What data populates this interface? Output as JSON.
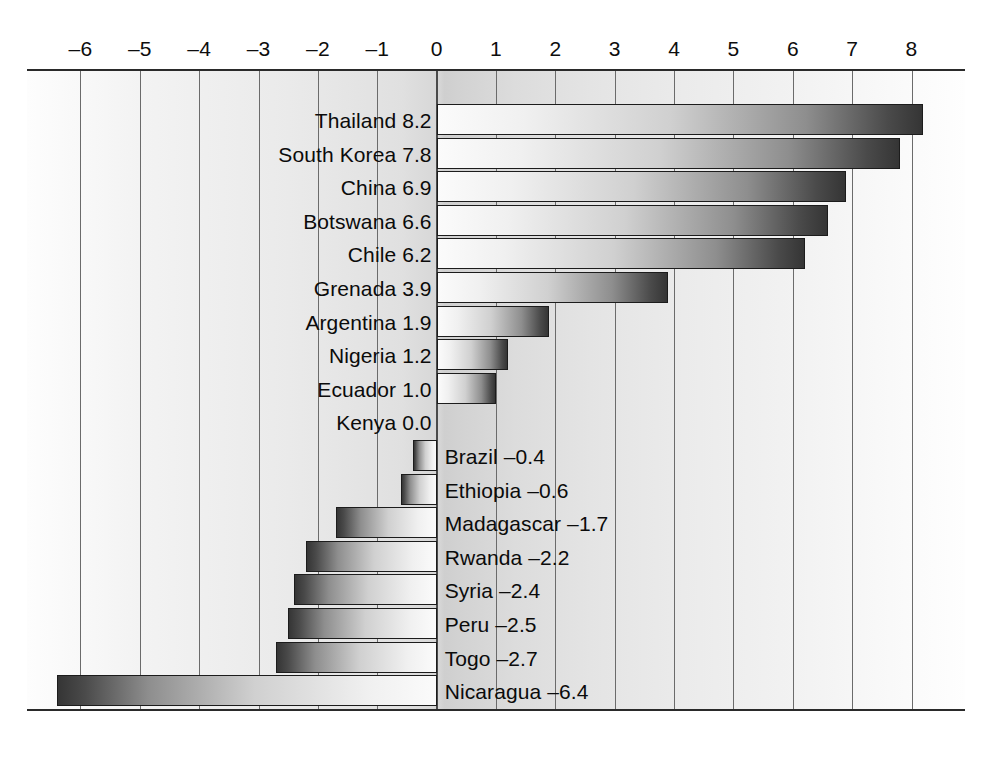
{
  "chart_data": {
    "type": "bar",
    "orientation": "horizontal",
    "title": "",
    "subtitle": "",
    "xlabel": "",
    "ylabel": "",
    "xlim": [
      -6.6,
      8.4
    ],
    "axis_min": -6.6,
    "axis_max": 8.4,
    "grid": true,
    "legend": "none",
    "tick_labels": [
      "–6",
      "–5",
      "–4",
      "–3",
      "–2",
      "–1",
      "0",
      "1",
      "2",
      "3",
      "4",
      "5",
      "6",
      "7",
      "8"
    ],
    "tick_values": [
      -6,
      -5,
      -4,
      -3,
      -2,
      -1,
      0,
      1,
      2,
      3,
      4,
      5,
      6,
      7,
      8
    ],
    "categories": [
      "Thailand",
      "South Korea",
      "China",
      "Botswana",
      "Chile",
      "Grenada",
      "Argentina",
      "Nigeria",
      "Ecuador",
      "Kenya",
      "Brazil",
      "Ethiopia",
      "Madagascar",
      "Rwanda",
      "Syria",
      "Peru",
      "Togo",
      "Nicaragua",
      "Cameroon"
    ],
    "values": [
      8.2,
      7.8,
      6.9,
      6.6,
      6.2,
      3.9,
      1.9,
      1.2,
      1.0,
      0.0,
      -0.4,
      -0.6,
      -1.7,
      -2.2,
      -2.4,
      -2.5,
      -2.7,
      -6.4,
      -6.6
    ],
    "bars": [
      {
        "label": "Thailand 8.2",
        "category": "Thailand",
        "value": 8.2,
        "display_value": "8.2",
        "sign": "positive"
      },
      {
        "label": "South Korea 7.8",
        "category": "South Korea",
        "value": 7.8,
        "display_value": "7.8",
        "sign": "positive"
      },
      {
        "label": "China 6.9",
        "category": "China",
        "value": 6.9,
        "display_value": "6.9",
        "sign": "positive"
      },
      {
        "label": "Botswana 6.6",
        "category": "Botswana",
        "value": 6.6,
        "display_value": "6.6",
        "sign": "positive"
      },
      {
        "label": "Chile 6.2",
        "category": "Chile",
        "value": 6.2,
        "display_value": "6.2",
        "sign": "positive"
      },
      {
        "label": "Grenada 3.9",
        "category": "Grenada",
        "value": 3.9,
        "display_value": "3.9",
        "sign": "positive"
      },
      {
        "label": "Argentina 1.9",
        "category": "Argentina",
        "value": 1.9,
        "display_value": "1.9",
        "sign": "positive"
      },
      {
        "label": "Nigeria 1.2",
        "category": "Nigeria",
        "value": 1.2,
        "display_value": "1.2",
        "sign": "positive"
      },
      {
        "label": "Ecuador 1.0",
        "category": "Ecuador",
        "value": 1.0,
        "display_value": "1.0",
        "sign": "positive"
      },
      {
        "label": "Kenya 0.0",
        "category": "Kenya",
        "value": 0.0,
        "display_value": "0.0",
        "sign": "zero"
      },
      {
        "label": "Brazil –0.4",
        "category": "Brazil",
        "value": -0.4,
        "display_value": "–0.4",
        "sign": "negative"
      },
      {
        "label": "Ethiopia –0.6",
        "category": "Ethiopia",
        "value": -0.6,
        "display_value": "–0.6",
        "sign": "negative"
      },
      {
        "label": "Madagascar –1.7",
        "category": "Madagascar",
        "value": -1.7,
        "display_value": "–1.7",
        "sign": "negative"
      },
      {
        "label": "Rwanda –2.2",
        "category": "Rwanda",
        "value": -2.2,
        "display_value": "–2.2",
        "sign": "negative"
      },
      {
        "label": "Syria –2.4",
        "category": "Syria",
        "value": -2.4,
        "display_value": "–2.4",
        "sign": "negative"
      },
      {
        "label": "Peru –2.5",
        "category": "Peru",
        "value": -2.5,
        "display_value": "–2.5",
        "sign": "negative"
      },
      {
        "label": "Togo –2.7",
        "category": "Togo",
        "value": -2.7,
        "display_value": "–2.7",
        "sign": "negative"
      },
      {
        "label": "Nicaragua –6.4",
        "category": "Nicaragua",
        "value": -6.4,
        "display_value": "–6.4",
        "sign": "negative"
      },
      {
        "label": "Cameroon –6.6",
        "category": "Cameroon",
        "value": -6.6,
        "display_value": "–6.6",
        "sign": "negative"
      }
    ]
  },
  "style": {
    "bar_dark": "#353535",
    "bar_light": "#fbfbfb",
    "gridline_color": "#6b6b6b",
    "axis_color": "#2a2a2a",
    "text_color": "#0b0b0b",
    "plot_background": "#e0e0e0"
  }
}
